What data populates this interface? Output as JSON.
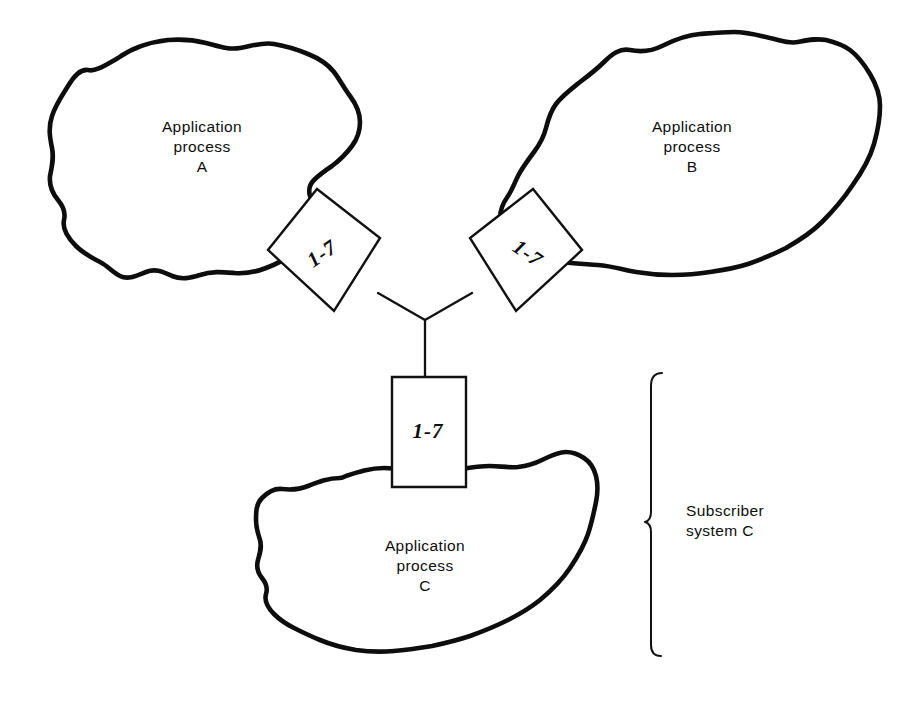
{
  "page": {
    "background_color": "#ffffff",
    "ink_color": "#0d0d0d",
    "width": 915,
    "height": 702
  },
  "processes": [
    {
      "id": "a",
      "line1": "Application",
      "line2": "process",
      "line3": "A"
    },
    {
      "id": "b",
      "line1": "Application",
      "line2": "process",
      "line3": "B"
    },
    {
      "id": "c",
      "line1": "Application",
      "line2": "process",
      "line3": "C"
    }
  ],
  "layer_boxes": [
    {
      "id": "box-a",
      "label": "1-7"
    },
    {
      "id": "box-b",
      "label": "1-7"
    },
    {
      "id": "box-c",
      "label": "1-7"
    }
  ],
  "bracket": {
    "line1": "Subscriber",
    "line2": "system C"
  }
}
